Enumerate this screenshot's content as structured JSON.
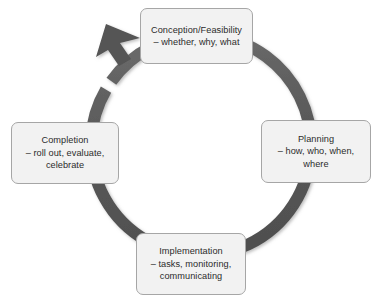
{
  "diagram": {
    "type": "cycle",
    "direction": "clockwise",
    "ring": {
      "color": "#585858",
      "center_x": 190,
      "center_y": 152,
      "outer_radius": 110,
      "thickness": 12,
      "arrowhead_count": 1,
      "arrowhead_position": "top-left"
    },
    "box_style": {
      "fill": "#f2f2f2",
      "border": "#a6a6a6",
      "text_color": "#2b2b2b"
    },
    "nodes": [
      {
        "id": "conception",
        "position": "top",
        "title": "Conception/Feasibility",
        "detail": "– whether, why, what",
        "label": "Conception/Feasibility\n– whether, why, what"
      },
      {
        "id": "planning",
        "position": "right",
        "title": "Planning",
        "detail": "– how, who, when, where",
        "label": "Planning\n– how, who, when,\nwhere"
      },
      {
        "id": "implementation",
        "position": "bottom",
        "title": "Implementation",
        "detail": "– tasks, monitoring, communicating",
        "label": "Implementation\n– tasks, monitoring,\ncommunicating"
      },
      {
        "id": "completion",
        "position": "left",
        "title": "Completion",
        "detail": "– roll out, evaluate, celebrate",
        "label": "Completion\n– roll out, evaluate,\ncelebrate"
      }
    ]
  }
}
